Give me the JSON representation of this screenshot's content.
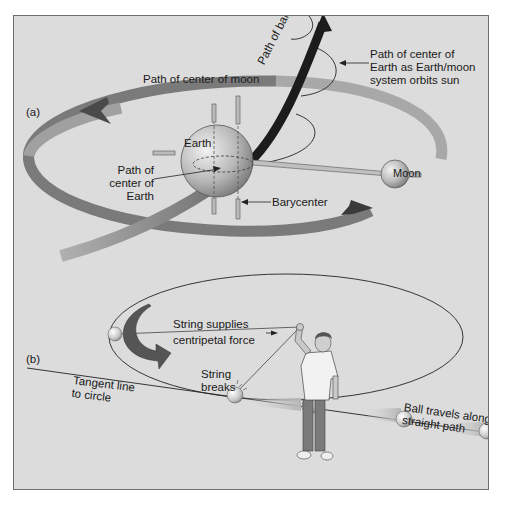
{
  "panel_a": {
    "label": "(a)",
    "moon_path_label": "Path of center of moon",
    "earth_label": "Earth",
    "moon_label": "Moon",
    "earth_path_label_line1": "Path of",
    "earth_path_label_line2": "center of",
    "earth_path_label_line3": "Earth",
    "barycenter_label": "Barycenter",
    "barycenter_path_label": "Path of barycenter",
    "sun_orbit_label_line1": "Path of center of",
    "sun_orbit_label_line2": "Earth as Earth/moon",
    "sun_orbit_label_line3": "system orbits sun"
  },
  "panel_b": {
    "label": "(b)",
    "string_label_line1": "String supplies",
    "string_label_line2": "centripetal force",
    "tangent_label_line1": "Tangent line",
    "tangent_label_line2": "to circle",
    "breaks_label_line1": "String",
    "breaks_label_line2": "breaks",
    "straight_label_line1": "Ball travels along",
    "straight_label_line2": "straight path"
  },
  "colors": {
    "background": "#dcdcdc",
    "frame_border": "#6e6e6e",
    "dark_arrow": "#3a3a3a",
    "band_light": "#9a9a9a",
    "sphere": "#c8c8c8"
  }
}
